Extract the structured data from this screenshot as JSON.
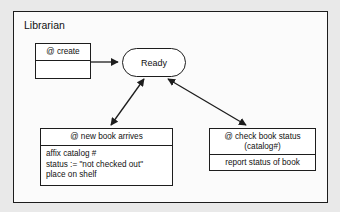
{
  "diagram": {
    "frame_title": "Librarian",
    "type": "state-transition-diagram",
    "state": {
      "label": "Ready"
    },
    "operations": [
      {
        "id": "create",
        "header": "@ create",
        "body": []
      },
      {
        "id": "new-book-arrives",
        "header": "@ new book arrives",
        "body": [
          "affix catalog #",
          "status := \"not checked out\"",
          "place on shelf"
        ]
      },
      {
        "id": "check-book-status",
        "header_line1": "@ check book status",
        "header_line2": "(catalog#)",
        "body": [
          "report status of book"
        ]
      }
    ],
    "connectors": [
      {
        "id": "create-to-ready",
        "from": "create",
        "to": "ready",
        "style": "single-arrow"
      },
      {
        "id": "ready-to-new-book",
        "from": "ready",
        "to": "new-book-arrives",
        "style": "double-arrow"
      },
      {
        "id": "ready-to-check-status",
        "from": "ready",
        "to": "check-book-status",
        "style": "double-arrow"
      }
    ],
    "colors": {
      "page_background": "#e9e9e9",
      "frame_background": "#fbfbfb",
      "box_background": "#ffffff",
      "stroke": "#1d1d1d",
      "text": "#111111"
    }
  }
}
